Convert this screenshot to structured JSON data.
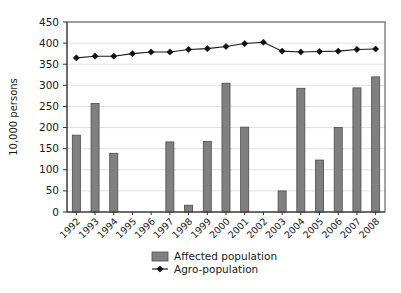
{
  "chart_data": {
    "type": "bar",
    "title": "",
    "subtitle": "",
    "xlabel": "",
    "ylabel": "10,000 persons",
    "ylim": [
      0,
      450
    ],
    "yticks": [
      0,
      50,
      100,
      150,
      200,
      250,
      300,
      350,
      400,
      450
    ],
    "grid": true,
    "legend_position": "bottom-center",
    "categories": [
      "1992",
      "1993",
      "1994",
      "1995",
      "1996",
      "1997",
      "1998",
      "1999",
      "2000",
      "2001",
      "2002",
      "2003",
      "2004",
      "2005",
      "2006",
      "2007",
      "2008"
    ],
    "series": [
      {
        "name": "Affected population",
        "type": "bar",
        "color": "#808080",
        "values": [
          182,
          257,
          139,
          0,
          0,
          166,
          16,
          167,
          305,
          201,
          0,
          50,
          293,
          123,
          200,
          294,
          320
        ]
      },
      {
        "name": "Agro-population",
        "type": "line",
        "color": "#101010",
        "marker": "diamond",
        "values": [
          365,
          369,
          369,
          375,
          379,
          379,
          385,
          387,
          392,
          399,
          402,
          381,
          379,
          380,
          381,
          385,
          386
        ]
      }
    ]
  },
  "axes": {
    "y_title": "10,000 persons",
    "y_tick_labels": [
      "0",
      "50",
      "100",
      "150",
      "200",
      "250",
      "300",
      "350",
      "400",
      "450"
    ],
    "x_tick_labels": [
      "1992",
      "1993",
      "1994",
      "1995",
      "1996",
      "1997",
      "1998",
      "1999",
      "2000",
      "2001",
      "2002",
      "2003",
      "2004",
      "2005",
      "2006",
      "2007",
      "2008"
    ]
  },
  "legend": {
    "items": [
      {
        "label": "Affected population",
        "symbol": "bar-swatch",
        "color": "#808080"
      },
      {
        "label": "Agro-population",
        "symbol": "line-diamond-marker",
        "color": "#101010"
      }
    ]
  },
  "colors": {
    "bar_fill": "#808080",
    "bar_stroke": "#4a4a4a",
    "line": "#101010",
    "grid": "#d9d9d9",
    "frame": "#4d4d4d",
    "text": "#1a1a1a",
    "background": "#ffffff"
  }
}
